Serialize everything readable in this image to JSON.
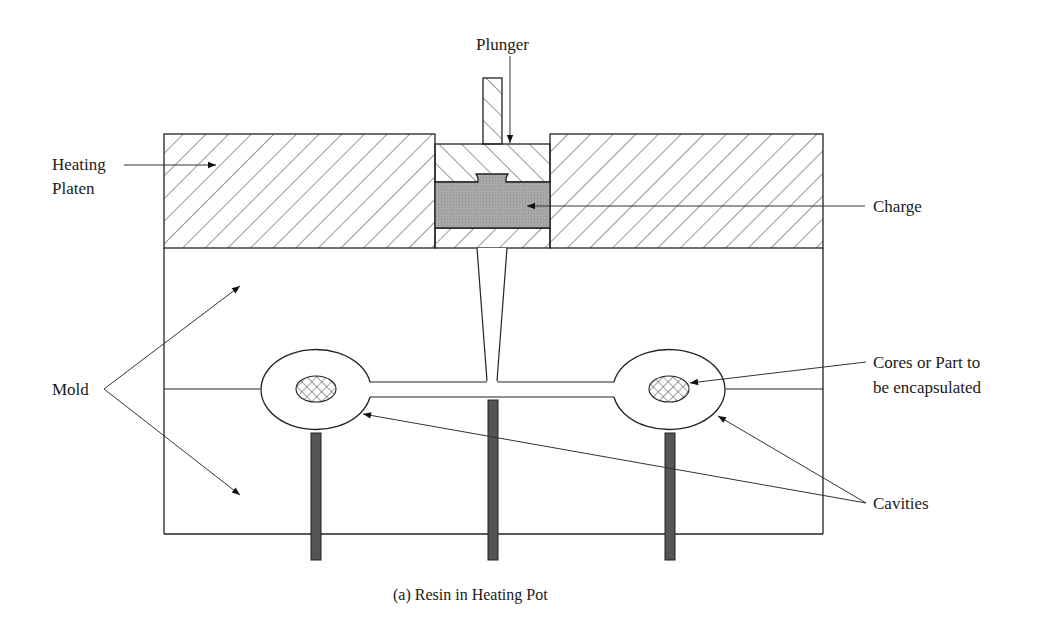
{
  "figure": {
    "caption": "(a) Resin in Heating Pot",
    "labels": {
      "plunger": "Plunger",
      "heating_platen_line1": "Heating",
      "heating_platen_line2": "Platen",
      "charge": "Charge",
      "mold": "Mold",
      "cores_line1": "Cores or Part to",
      "cores_line2": "be encapsulated",
      "cavities": "Cavities"
    },
    "colors": {
      "line": "#222222",
      "charge_fill": "#a8a8a8",
      "pin_fill": "#555555",
      "background": "#ffffff"
    }
  }
}
